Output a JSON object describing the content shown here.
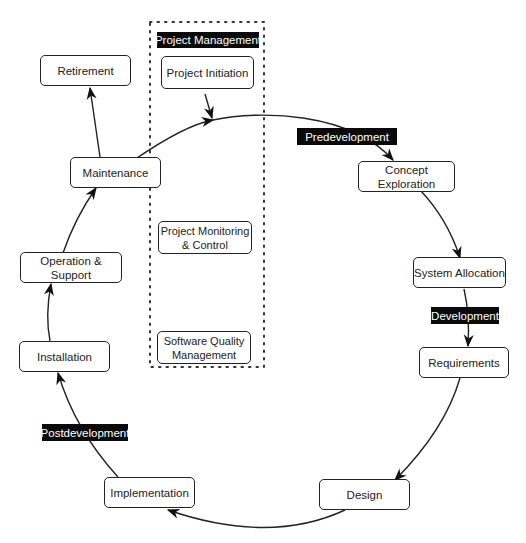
{
  "project_management": {
    "label": "Project Management",
    "boxes": {
      "initiation": "Project Initiation",
      "monitoring_line1": "Project Monitoring",
      "monitoring_line2": "& Control",
      "quality_line1": "Software Quality",
      "quality_line2": "Management"
    }
  },
  "phases": {
    "predevelopment": "Predevelopment",
    "development": "Development",
    "postdevelopment": "Postdevelopment"
  },
  "nodes": {
    "concept_exploration": "Concept Exploration",
    "system_allocation": "System Allocation",
    "requirements": "Requirements",
    "design": "Design",
    "implementation": "Implementation",
    "installation": "Installation",
    "operation_support": "Operation & Support",
    "maintenance": "Maintenance",
    "retirement": "Retirement"
  },
  "colors": {
    "stroke": "#222222",
    "tag_background": "#0a0a0a",
    "tag_text": "#ffffff"
  }
}
